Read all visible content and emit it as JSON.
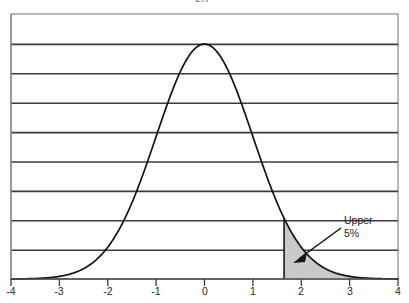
{
  "figure": {
    "top_clipped_label": "2.7",
    "annotation": {
      "line1": "Upper",
      "line2": "5%",
      "arrow_name": "callout-arrow"
    },
    "colors": {
      "curve": "#1a1a1a",
      "gridline": "#3a3a3a",
      "frame": "#6e6e6e",
      "shade_fill": "#c9c9c9",
      "axis": "#4a4a4a",
      "background": "#ffffff"
    }
  },
  "chart_data": {
    "type": "area",
    "title": "",
    "subtitle": "",
    "xlabel": "",
    "ylabel": "",
    "grid": true,
    "legend": null,
    "xlim": [
      -4,
      4
    ],
    "ylim": [
      0,
      0.45
    ],
    "xticks": [
      -4,
      -3,
      -2,
      -1,
      0,
      1,
      2,
      3,
      4
    ],
    "xticklabels": [
      "-4",
      "-3",
      "-2",
      "-1",
      "0",
      "1",
      "2",
      "3",
      "4"
    ],
    "yticks": [
      0,
      0.05,
      0.1,
      0.15,
      0.2,
      0.25,
      0.3,
      0.35,
      0.4,
      0.45
    ],
    "yticklabels": [
      "",
      "",
      "",
      "",
      "",
      "",
      "",
      "",
      "",
      ""
    ],
    "gridline_count": 9,
    "series": [
      {
        "name": "Standard normal density",
        "distribution": "normal",
        "mean": 0,
        "sd": 1,
        "peak_x": 0,
        "peak_y": 0.3989,
        "x": [
          -4.0,
          -3.75,
          -3.5,
          -3.25,
          -3.0,
          -2.75,
          -2.5,
          -2.25,
          -2.0,
          -1.75,
          -1.5,
          -1.25,
          -1.0,
          -0.75,
          -0.5,
          -0.25,
          0.0,
          0.25,
          0.5,
          0.75,
          1.0,
          1.25,
          1.5,
          1.75,
          2.0,
          2.25,
          2.5,
          2.75,
          3.0,
          3.25,
          3.5,
          3.75,
          4.0
        ],
        "y": [
          0.0001,
          0.0004,
          0.0009,
          0.002,
          0.0044,
          0.0091,
          0.0175,
          0.0317,
          0.054,
          0.0863,
          0.1295,
          0.1826,
          0.242,
          0.3011,
          0.3521,
          0.3867,
          0.3989,
          0.3867,
          0.3521,
          0.3011,
          0.242,
          0.1826,
          0.1295,
          0.0863,
          0.054,
          0.0317,
          0.0175,
          0.0091,
          0.0044,
          0.002,
          0.0009,
          0.0004,
          0.0001
        ]
      }
    ],
    "shaded_region": {
      "label": "Upper 5%",
      "area": 0.05,
      "from_x": 1.645,
      "to_x": 4.0,
      "critical_value": 1.645,
      "fill": "#c9c9c9"
    },
    "annotations": [
      {
        "text": "Upper 5%",
        "text_x": 2.45,
        "text_y": 0.155,
        "arrow_tip_x": 1.82,
        "arrow_tip_y": 0.045
      }
    ]
  }
}
